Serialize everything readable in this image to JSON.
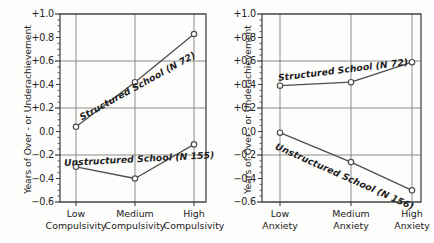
{
  "figure": {
    "background": "#fdfdfc",
    "axis_color": "#3a3a3a",
    "grid_color": "#6e6e6e",
    "line_color": "#4d4d4d",
    "marker_fill": "#ffffff"
  },
  "chart_data": [
    {
      "type": "line",
      "panel": "left",
      "title": "",
      "xlabel": "",
      "ylabel": "Years of Over - or Underachievement",
      "categories": [
        "Low\nCompulsivity",
        "Medium\nCompulsivity",
        "High\nCompulsivity"
      ],
      "category_lines": [
        [
          "Low",
          "Compulsivity"
        ],
        [
          "Medium",
          "Compulsivity"
        ],
        [
          "High",
          "Compulsivity"
        ]
      ],
      "ylim": [
        -0.6,
        1.0
      ],
      "yticks": [
        1.0,
        0.8,
        0.6,
        0.4,
        0.2,
        0.0,
        -0.2,
        -0.4,
        -0.6
      ],
      "ytick_labels": [
        "+1.0",
        "+0.8",
        "+0.6",
        "+0.4",
        "+0.2",
        "0.0",
        "−0.2",
        "−0.4",
        "−0.6"
      ],
      "gridlines_y": [
        1.0,
        0.6,
        0.2,
        -0.2,
        -0.6
      ],
      "grid": true,
      "legend_position": "inline-annotation",
      "series": [
        {
          "name": "Structured School (N 72)",
          "label": "Structured School (N 72)",
          "n": 72,
          "values": [
            0.04,
            0.42,
            0.83
          ]
        },
        {
          "name": "Unstructured School (N 155)",
          "label": "Unstructured School (N 155)",
          "n": 155,
          "values": [
            -0.3,
            -0.4,
            -0.11
          ]
        }
      ]
    },
    {
      "type": "line",
      "panel": "right",
      "title": "",
      "xlabel": "",
      "ylabel": "Years of Over - or Underachievement",
      "categories": [
        "Low\nAnxiety",
        "Medium\nAnxiety",
        "High\nAnxiety"
      ],
      "category_lines": [
        [
          "Low",
          "Anxiety"
        ],
        [
          "Medium",
          "Anxiety"
        ],
        [
          "High",
          "Anxiety"
        ]
      ],
      "ylim": [
        -0.6,
        1.0
      ],
      "yticks": [
        1.0,
        0.8,
        0.6,
        0.4,
        0.2,
        0.0,
        -0.2,
        -0.4,
        -0.6
      ],
      "ytick_labels": [
        "+1.0",
        "+0.8",
        "+0.6",
        "+0.4",
        "+0.2",
        "0.0",
        "−0.2",
        "−0.4",
        "−0.6"
      ],
      "gridlines_y": [
        1.0,
        0.6,
        0.2,
        -0.2,
        -0.6
      ],
      "grid": true,
      "legend_position": "inline-annotation",
      "series": [
        {
          "name": "Structured School (N 72)",
          "label": "Structured School (N 72)",
          "n": 72,
          "values": [
            0.39,
            0.42,
            0.59
          ]
        },
        {
          "name": "Unstructured School (N 156)",
          "label": "Unstructured School (N 156)",
          "n": 156,
          "values": [
            -0.01,
            -0.26,
            -0.5
          ]
        }
      ]
    }
  ],
  "panels": {
    "left": {
      "ylabel": "Years of Over - or Underachievement",
      "ytick_labels": [
        "+1.0",
        "+0.8",
        "+0.6",
        "+0.4",
        "+0.2",
        "0.0",
        "−0.2",
        "−0.4",
        "−0.6"
      ],
      "xtick_labels": [
        {
          "line1": "Low",
          "line2": "Compulsivity"
        },
        {
          "line1": "Medium",
          "line2": "Compulsivity"
        },
        {
          "line1": "High",
          "line2": "Compulsivity"
        }
      ],
      "series_labels": {
        "structured": "Structured School (N 72)",
        "unstructured": "Unstructured School (N 155)"
      }
    },
    "right": {
      "ylabel": "Years of Over - or Underachievement",
      "ytick_labels": [
        "+1.0",
        "+0.8",
        "+0.6",
        "+0.4",
        "+0.2",
        "0.0",
        "−0.2",
        "−0.4",
        "−0.6"
      ],
      "xtick_labels": [
        {
          "line1": "Low",
          "line2": "Anxiety"
        },
        {
          "line1": "Medium",
          "line2": "Anxiety"
        },
        {
          "line1": "High",
          "line2": "Anxiety"
        }
      ],
      "series_labels": {
        "structured": "Structured School (N 72)",
        "unstructured": "Unstructured School (N 156)"
      }
    }
  }
}
